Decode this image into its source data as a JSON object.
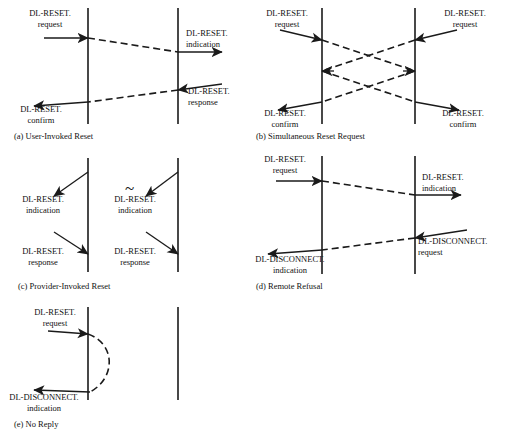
{
  "figure": {
    "type": "sequence-diagram-set",
    "primitive_names": {
      "reset_request": "DL-RESET.\nrequest",
      "reset_indication": "DL-RESET.\nindication",
      "reset_response": "DL-RESET.\nresponse",
      "reset_confirm": "DL-RESET.\nconfirm",
      "disconnect_request": "DL-DISCONNECT.\nrequest",
      "disconnect_indication": "DL-DISCONNECT.\nindication"
    }
  },
  "panels": [
    {
      "id": "a",
      "caption": "(a) User-Invoked Reset",
      "labels": [
        {
          "name": "reset-request-left",
          "line1": "DL-RESET.",
          "line2": "request"
        },
        {
          "name": "reset-indication-right",
          "line1": "DL-RESET.",
          "line2": "indication"
        },
        {
          "name": "reset-response-right",
          "line1": "DL-RESET.",
          "line2": "response"
        },
        {
          "name": "reset-confirm-left",
          "line1": "DL-RESET.",
          "line2": "confirm"
        }
      ]
    },
    {
      "id": "b",
      "caption": "(b) Simultaneous Reset Request",
      "labels": [
        {
          "name": "reset-request-left",
          "line1": "DL-RESET.",
          "line2": "request"
        },
        {
          "name": "reset-request-right",
          "line1": "DL-RESET.",
          "line2": "request"
        },
        {
          "name": "reset-confirm-left",
          "line1": "DL-RESET.",
          "line2": "confirm"
        },
        {
          "name": "reset-confirm-right",
          "line1": "DL-RESET.",
          "line2": "confirm"
        }
      ]
    },
    {
      "id": "c",
      "caption": "(c) Provider-Invoked Reset",
      "separator": "~",
      "labels": [
        {
          "name": "reset-indication-left",
          "line1": "DL-RESET.",
          "line2": "indication"
        },
        {
          "name": "reset-response-left",
          "line1": "DL-RESET.",
          "line2": "response"
        },
        {
          "name": "reset-indication-right",
          "line1": "DL-RESET.",
          "line2": "indication"
        },
        {
          "name": "reset-response-right",
          "line1": "DL-RESET.",
          "line2": "response"
        }
      ]
    },
    {
      "id": "d",
      "caption": "(d) Remote Refusal",
      "labels": [
        {
          "name": "reset-request-left",
          "line1": "DL-RESET.",
          "line2": "request"
        },
        {
          "name": "reset-indication-right",
          "line1": "DL-RESET.",
          "line2": "indication"
        },
        {
          "name": "disconnect-request-right",
          "line1": "DL-DISCONNECT.",
          "line2": "request"
        },
        {
          "name": "disconnect-indication-left",
          "line1": "DL-DISCONNECT.",
          "line2": "indication"
        }
      ]
    },
    {
      "id": "e",
      "caption": "(e) No Reply",
      "labels": [
        {
          "name": "reset-request-left",
          "line1": "DL-RESET.",
          "line2": "request"
        },
        {
          "name": "disconnect-indication-left",
          "line1": "DL-DISCONNECT.",
          "line2": "indication"
        }
      ]
    }
  ],
  "colors": {
    "ink": "#1a1a1a",
    "background": "#ffffff"
  }
}
